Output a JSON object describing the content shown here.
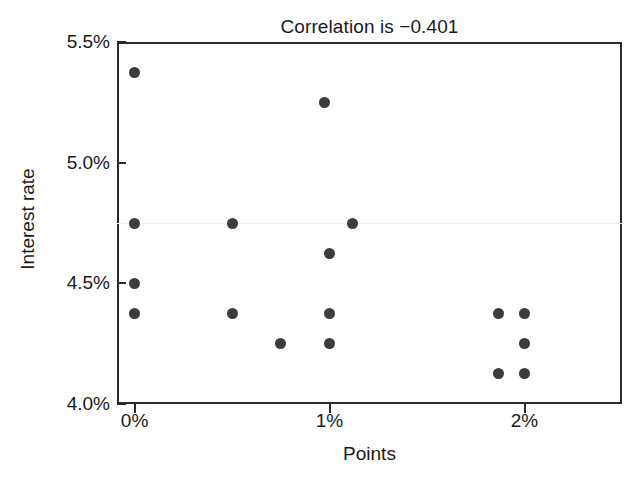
{
  "chart_data": {
    "type": "scatter",
    "title": "Correlation is −0.401",
    "xlabel": "Points",
    "ylabel": "Interest rate",
    "xlim": [
      -0.09,
      2.5
    ],
    "ylim": [
      4.0,
      5.5
    ],
    "grid": false,
    "legend": null,
    "xticks": [
      {
        "value": 0,
        "label": "0%"
      },
      {
        "value": 1,
        "label": "1%"
      },
      {
        "value": 2,
        "label": "2%"
      }
    ],
    "yticks": [
      {
        "value": 4.0,
        "label": "4.0%"
      },
      {
        "value": 4.5,
        "label": "4.5%"
      },
      {
        "value": 5.0,
        "label": "5.0%"
      },
      {
        "value": 5.5,
        "label": "5.5%"
      }
    ],
    "reference_lines": [
      {
        "axis": "y",
        "value": 4.75,
        "color": "#f0f0f0"
      }
    ],
    "marker": {
      "shape": "circle",
      "color": "#3c3c3c",
      "size": 11
    },
    "points": [
      {
        "x": 0.0,
        "y": 5.375
      },
      {
        "x": 0.0,
        "y": 4.75
      },
      {
        "x": 0.0,
        "y": 4.5
      },
      {
        "x": 0.0,
        "y": 4.375
      },
      {
        "x": 0.5,
        "y": 4.75
      },
      {
        "x": 0.5,
        "y": 4.375
      },
      {
        "x": 0.75,
        "y": 4.25
      },
      {
        "x": 0.975,
        "y": 5.25
      },
      {
        "x": 1.0,
        "y": 4.625
      },
      {
        "x": 1.0,
        "y": 4.375
      },
      {
        "x": 1.0,
        "y": 4.25
      },
      {
        "x": 1.12,
        "y": 4.75
      },
      {
        "x": 1.865,
        "y": 4.375
      },
      {
        "x": 1.865,
        "y": 4.125
      },
      {
        "x": 2.0,
        "y": 4.375
      },
      {
        "x": 2.0,
        "y": 4.25
      },
      {
        "x": 2.0,
        "y": 4.125
      }
    ]
  }
}
